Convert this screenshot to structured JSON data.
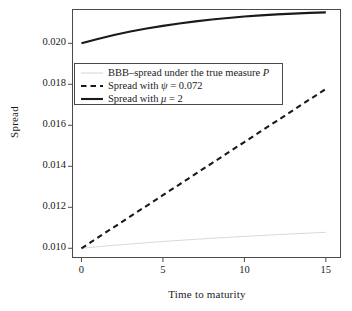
{
  "chart_data": {
    "type": "line",
    "title": "",
    "xlabel": "Time to maturity",
    "ylabel": "Spread",
    "xlim": [
      -0.55,
      15.9
    ],
    "ylim": [
      0.00955,
      0.02165
    ],
    "xticks": [
      0,
      5,
      10,
      15
    ],
    "xticklabels": [
      "0",
      "5",
      "10",
      "15"
    ],
    "yticks": [
      0.01,
      0.012,
      0.014,
      0.016,
      0.018,
      0.02
    ],
    "yticklabels": [
      "0.010",
      "0.012",
      "0.014",
      "0.016",
      "0.018",
      "0.020"
    ],
    "grid": false,
    "legend_position": "upper left",
    "series": [
      {
        "name": "BBB-spread under the true measure P",
        "style": "solid",
        "color": "#d9d9d9",
        "width": 1.0,
        "x": [
          0,
          1,
          2,
          3,
          4,
          5,
          6,
          7,
          8,
          9,
          10,
          11,
          12,
          13,
          14,
          15
        ],
        "values": [
          0.01,
          0.010075,
          0.010145,
          0.01021,
          0.010272,
          0.01033,
          0.010385,
          0.010437,
          0.010487,
          0.010534,
          0.01058,
          0.010623,
          0.010665,
          0.010705,
          0.010743,
          0.01078
        ]
      },
      {
        "name": "Spread with psi = 0.072",
        "style": "dashed",
        "color": "#1a1a1a",
        "width": 2.1,
        "x": [
          0,
          1,
          2,
          3,
          4,
          5,
          6,
          7,
          8,
          9,
          10,
          11,
          12,
          13,
          14,
          15
        ],
        "values": [
          0.01,
          0.010518,
          0.011037,
          0.011555,
          0.012073,
          0.012592,
          0.01311,
          0.013628,
          0.014147,
          0.014665,
          0.015183,
          0.015702,
          0.01622,
          0.016738,
          0.017257,
          0.017775
        ]
      },
      {
        "name": "Spread with mu = 2",
        "style": "solid",
        "color": "#1a1a1a",
        "width": 2.1,
        "x": [
          0,
          1,
          2,
          3,
          4,
          5,
          6,
          7,
          8,
          9,
          10,
          11,
          12,
          13,
          14,
          15
        ],
        "values": [
          0.02,
          0.020215,
          0.020405,
          0.020572,
          0.02072,
          0.020852,
          0.020968,
          0.02107,
          0.02116,
          0.021238,
          0.021305,
          0.021362,
          0.02141,
          0.02145,
          0.021483,
          0.02151
        ]
      }
    ]
  },
  "axes": {
    "ylabel": "Spread",
    "xlabel": "Time to maturity",
    "yticklabels": [
      "0.020",
      "0.018",
      "0.016",
      "0.014",
      "0.012",
      "0.010"
    ],
    "xticklabels": [
      "0",
      "5",
      "10",
      "15"
    ]
  },
  "legend": {
    "entries": [
      {
        "label_pre": "BBB–spread under the true measure ",
        "label_sym": "P",
        "label_post": "",
        "key": "solid-light-key"
      },
      {
        "label_pre": "Spread with ",
        "label_sym": "ψ",
        "label_post": " = 0.072",
        "key": "dashed-black-key"
      },
      {
        "label_pre": "Spread with ",
        "label_sym": "μ",
        "label_post": " = 2",
        "key": "solid-black-key"
      }
    ]
  },
  "colors": {
    "frame": "#4a4a4a",
    "line_black": "#1a1a1a",
    "line_light": "#d9d9d9",
    "background": "#ffffff"
  }
}
